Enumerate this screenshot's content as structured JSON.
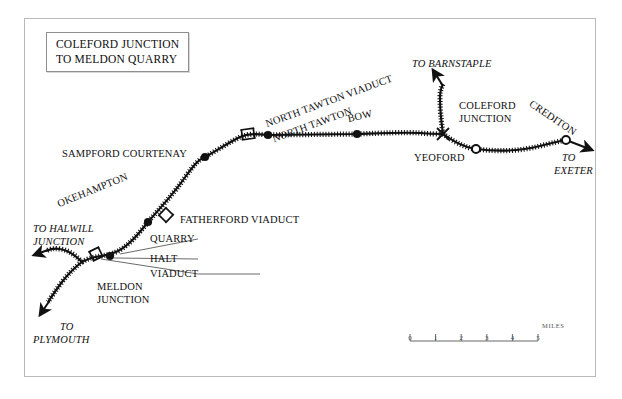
{
  "map": {
    "title_lines": [
      "COLEFORD JUNCTION",
      "TO MELDON QUARRY"
    ],
    "frame_color": "#b9b9b9",
    "line_color": "#111111",
    "background": "#ffffff",
    "stations": [
      {
        "name": "SAMPFORD COURTENAY",
        "marker": "filled-dot",
        "x": 205,
        "y": 157
      },
      {
        "name": "NORTH TAWTON",
        "marker": "filled-dot",
        "x": 268,
        "y": 135
      },
      {
        "name": "BOW",
        "marker": "filled-dot",
        "x": 357,
        "y": 134
      },
      {
        "name": "YEOFORD",
        "marker": "open-circle",
        "x": 476,
        "y": 149
      },
      {
        "name": "CREDITON",
        "marker": "open-circle",
        "x": 566,
        "y": 140
      },
      {
        "name": "OKEHAMPTON",
        "marker": "filled-dot",
        "x": 148,
        "y": 222
      },
      {
        "name": "MELDON QUARRY HALT",
        "marker": "filled-dot",
        "x": 110,
        "y": 256
      }
    ],
    "junctions": [
      {
        "name": "COLEFORD JUNCTION",
        "x": 443,
        "y": 134
      },
      {
        "name": "MELDON JUNCTION",
        "x": 82,
        "y": 262
      }
    ],
    "viaducts": [
      {
        "name": "NORTH TAWTON VIADUCT",
        "x": 248,
        "y": 134
      },
      {
        "name": "FATHERFORD VIADUCT",
        "x": 166,
        "y": 215
      },
      {
        "name": "MELDON VIADUCT",
        "x": 96,
        "y": 254
      }
    ],
    "labels": {
      "sampford_courtenay": "SAMPFORD COURTENAY",
      "north_tawton_viaduct": "NORTH TAWTON VIADUCT",
      "north_tawton": "NORTH TAWTON",
      "bow": "BOW",
      "coleford_junction_l1": "COLEFORD",
      "coleford_junction_l2": "JUNCTION",
      "yeoford": "YEOFORD",
      "crediton": "CREDITON",
      "okehampton": "OKEHAMPTON",
      "fatherford_viaduct": "FATHERFORD VIADUCT",
      "quarry": "QUARRY",
      "halt": "HALT",
      "viaduct": "VIADUCT",
      "meldon_junction_l1": "MELDON",
      "meldon_junction_l2": "JUNCTION"
    },
    "destinations": {
      "to_barnstaple": "TO BARNSTAPLE",
      "to_exeter_l1": "TO",
      "to_exeter_l2": "EXETER",
      "to_halwill_l1": "TO HALWILL",
      "to_halwill_l2": "JUNCTION",
      "to_plymouth_l1": "TO",
      "to_plymouth_l2": "PLYMOUTH"
    },
    "scale": {
      "ticks": [
        "0",
        "1",
        "2",
        "3",
        "4",
        "5"
      ],
      "units": "MILES"
    }
  }
}
